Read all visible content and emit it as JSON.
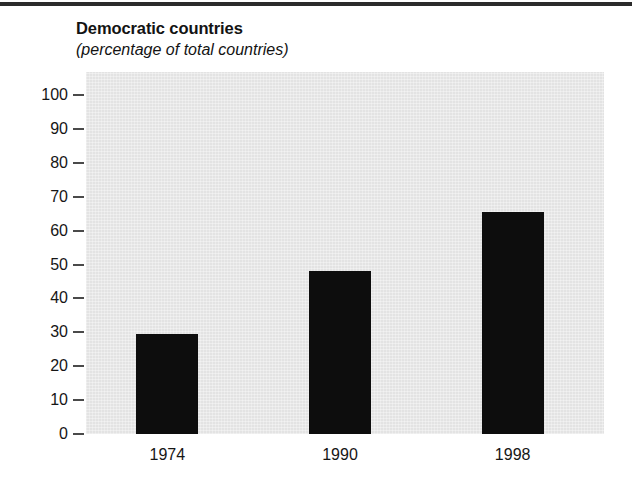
{
  "chart_data": {
    "type": "bar",
    "title": "Democratic countries",
    "subtitle": "(percentage of total countries)",
    "categories": [
      "1974",
      "1990",
      "1998"
    ],
    "values": [
      29.5,
      48,
      65.5
    ],
    "series": [
      {
        "name": "Democratic countries",
        "values": [
          29.5,
          48,
          65.5
        ]
      }
    ],
    "xlabel": "",
    "ylabel": "",
    "ylim": [
      0,
      100
    ],
    "yticks": [
      0,
      10,
      20,
      30,
      40,
      50,
      60,
      70,
      80,
      90,
      100
    ],
    "ytick_labels": [
      "0",
      "10",
      "20",
      "30",
      "40",
      "50",
      "60",
      "70",
      "80",
      "90",
      "100"
    ],
    "grid": false,
    "legend": false,
    "bar_color": "#0d0d0d",
    "plot_background": "#e3e3e3",
    "page_background": "#ffffff"
  }
}
